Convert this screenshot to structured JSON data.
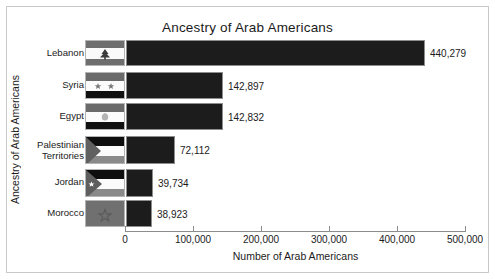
{
  "chart_data": {
    "type": "bar",
    "orientation": "horizontal",
    "title": "Ancestry of Arab Americans",
    "xlabel": "Number of Arab Americans",
    "ylabel": "Ancestry of Arab Americans",
    "categories": [
      "Lebanon",
      "Syria",
      "Egypt",
      "Palestinian\nTerritories",
      "Jordan",
      "Morocco"
    ],
    "values": [
      440279,
      142897,
      142832,
      72112,
      39734,
      38923
    ],
    "value_labels": [
      "440,279",
      "142,897",
      "142,832",
      "72,112",
      "39,734",
      "38,923"
    ],
    "xlim": [
      0,
      500000
    ],
    "xticks": [
      0,
      100000,
      200000,
      300000,
      400000,
      500000
    ],
    "xticklabels": [
      "0",
      "100,000",
      "200,000",
      "300,000",
      "400,000",
      "500,000"
    ],
    "grid": false,
    "legend": false,
    "bar_color": "#1c1c1c",
    "frame_color": "#c9c9c9",
    "text_color": "#1b1b1b"
  },
  "flags": [
    {
      "name": "lebanon-flag",
      "country": "Lebanon",
      "emblem": "cedar-tree"
    },
    {
      "name": "syria-flag",
      "country": "Syria",
      "emblem": "two-stars"
    },
    {
      "name": "egypt-flag",
      "country": "Egypt",
      "emblem": "eagle"
    },
    {
      "name": "palestine-flag",
      "country": "Palestinian Territories",
      "emblem": "triangle"
    },
    {
      "name": "jordan-flag",
      "country": "Jordan",
      "emblem": "triangle-star"
    },
    {
      "name": "morocco-flag",
      "country": "Morocco",
      "emblem": "pentagram"
    }
  ]
}
